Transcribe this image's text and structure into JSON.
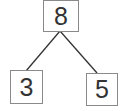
{
  "diagram": {
    "type": "number-bond",
    "whole": {
      "value": "8"
    },
    "parts": [
      {
        "value": "3"
      },
      {
        "value": "5"
      }
    ],
    "colors": {
      "border": "#8a8a8a",
      "line": "#333333",
      "text": "#333333"
    }
  }
}
